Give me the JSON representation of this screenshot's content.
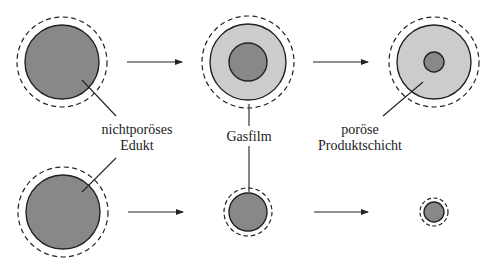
{
  "colors": {
    "core": "#888888",
    "product_layer": "#cccccc",
    "stroke": "#222222",
    "background": "#ffffff"
  },
  "labels": {
    "edukt_line1": "nichtporöses",
    "edukt_line2": "Edukt",
    "gasfilm": "Gasfilm",
    "produkt_line1": "poröse",
    "produkt_line2": "Produktschicht"
  },
  "rows": [
    {
      "name": "shrinking-core-model",
      "stages": [
        {
          "cx": 62,
          "cy": 62,
          "outer_r": 37,
          "core_r": 37,
          "film_r": 45
        },
        {
          "cx": 248,
          "cy": 62,
          "outer_r": 38,
          "core_r": 19,
          "film_r": 46
        },
        {
          "cx": 434,
          "cy": 62,
          "outer_r": 37,
          "core_r": 10,
          "film_r": 45
        }
      ]
    },
    {
      "name": "shrinking-particle-model",
      "stages": [
        {
          "cx": 63,
          "cy": 212,
          "core_r": 37,
          "film_r": 45
        },
        {
          "cx": 248,
          "cy": 212,
          "core_r": 19,
          "film_r": 24
        },
        {
          "cx": 434,
          "cy": 212,
          "core_r": 10,
          "film_r": 14
        }
      ]
    }
  ]
}
